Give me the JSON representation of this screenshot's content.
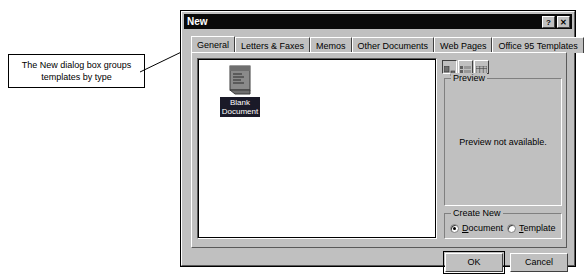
{
  "annotation": {
    "callout_text": "The New dialog box groups templates by type",
    "leader_icon": "arrow-leader-line"
  },
  "dialog": {
    "title": "New",
    "titlebar_buttons": [
      {
        "name": "help-button",
        "glyph": "?"
      },
      {
        "name": "close-button",
        "glyph": "✕"
      }
    ],
    "tabs": [
      {
        "label": "General",
        "active": true
      },
      {
        "label": "Letters & Faxes",
        "active": false
      },
      {
        "label": "Memos",
        "active": false
      },
      {
        "label": "Other Documents",
        "active": false
      },
      {
        "label": "Web Pages",
        "active": false
      },
      {
        "label": "Office 95 Templates",
        "active": false
      }
    ],
    "template_list": {
      "items": [
        {
          "label_line1": "Blank",
          "label_line2": "Document",
          "selected": true,
          "icon": "blank-document-icon"
        }
      ]
    },
    "view_toolbar": [
      {
        "name": "large-icons-view-button",
        "icon": "large-icons-icon",
        "pressed": true
      },
      {
        "name": "list-view-button",
        "icon": "list-view-icon",
        "pressed": false
      },
      {
        "name": "details-view-button",
        "icon": "details-view-icon",
        "pressed": false
      }
    ],
    "preview": {
      "group_label": "Preview",
      "message": "Preview not available."
    },
    "create_new": {
      "group_label": "Create New",
      "options": [
        {
          "label_accel": "D",
          "label_rest": "ocument",
          "checked": true
        },
        {
          "label_accel": "T",
          "label_rest": "emplate",
          "checked": false
        }
      ]
    },
    "buttons": {
      "ok": "OK",
      "cancel": "Cancel"
    }
  },
  "colors": {
    "face": "#c0c0c0",
    "titlebar": "#0a0a0a",
    "titlebar_text": "#ffffff",
    "selection": "#1a1a28",
    "list_background": "#ffffff"
  }
}
